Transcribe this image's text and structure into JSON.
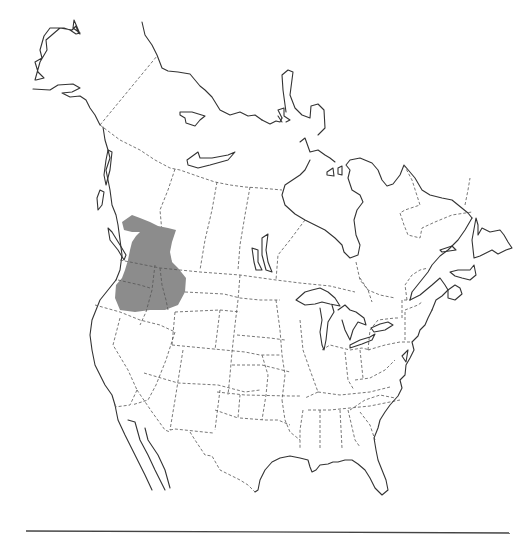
{
  "map": {
    "region": "North America",
    "type": "species range map",
    "colors": {
      "background": "#ffffff",
      "coastline": "#333333",
      "political_border": "#555555",
      "range_fill": "#8c8c8c",
      "baseline_rule": "#444444"
    },
    "range": {
      "label": "Distribution range",
      "area": "Pacific Northwest — southern British Columbia, eastern Washington, northern Idaho, northeastern Oregon, western Montana"
    }
  }
}
